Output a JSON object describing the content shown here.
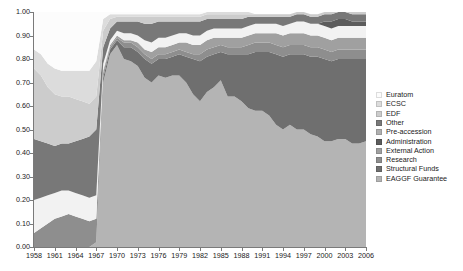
{
  "chart_data": {
    "type": "area",
    "title": "",
    "subtitle": "",
    "xlabel": "",
    "ylabel": "",
    "stacked": true,
    "normalized": true,
    "grid": false,
    "legend_position": "right",
    "xlim": [
      1958,
      2006
    ],
    "ylim": [
      0.0,
      1.0
    ],
    "y_ticks": [
      "0.00",
      "0.10",
      "0.20",
      "0.30",
      "0.40",
      "0.50",
      "0.60",
      "0.70",
      "0.80",
      "0.90",
      "1.00"
    ],
    "y_tick_values": [
      0.0,
      0.1,
      0.2,
      0.3,
      0.4,
      0.5,
      0.6,
      0.7,
      0.8,
      0.9,
      1.0
    ],
    "x_ticks": [
      "1958",
      "1961",
      "1964",
      "1967",
      "1970",
      "1973",
      "1976",
      "1979",
      "1982",
      "1985",
      "1988",
      "1991",
      "1994",
      "1997",
      "2000",
      "2003",
      "2006"
    ],
    "x_tick_values": [
      1958,
      1961,
      1964,
      1967,
      1970,
      1973,
      1976,
      1979,
      1982,
      1985,
      1988,
      1991,
      1994,
      1997,
      2000,
      2003,
      2006
    ],
    "x": [
      1958,
      1959,
      1960,
      1961,
      1962,
      1963,
      1964,
      1965,
      1966,
      1967,
      1968,
      1969,
      1970,
      1971,
      1972,
      1973,
      1974,
      1975,
      1976,
      1977,
      1978,
      1979,
      1980,
      1981,
      1982,
      1983,
      1984,
      1985,
      1986,
      1987,
      1988,
      1989,
      1990,
      1991,
      1992,
      1993,
      1994,
      1995,
      1996,
      1997,
      1998,
      1999,
      2000,
      2001,
      2002,
      2003,
      2004,
      2005,
      2006
    ],
    "series": [
      {
        "name": "EAGGF Guarantee",
        "color": "#b4b4b4",
        "values": [
          0.0,
          0.0,
          0.0,
          0.0,
          0.0,
          0.0,
          0.0,
          0.0,
          0.0,
          0.02,
          0.7,
          0.82,
          0.86,
          0.8,
          0.79,
          0.77,
          0.72,
          0.7,
          0.73,
          0.72,
          0.73,
          0.73,
          0.7,
          0.65,
          0.62,
          0.66,
          0.68,
          0.71,
          0.64,
          0.64,
          0.62,
          0.59,
          0.58,
          0.58,
          0.56,
          0.52,
          0.5,
          0.52,
          0.5,
          0.5,
          0.48,
          0.47,
          0.45,
          0.45,
          0.46,
          0.46,
          0.44,
          0.44,
          0.45
        ]
      },
      {
        "name": "Structural Funds",
        "color": "#6f6f6f",
        "values": [
          0.0,
          0.0,
          0.0,
          0.0,
          0.0,
          0.0,
          0.0,
          0.0,
          0.0,
          0.0,
          0.02,
          0.02,
          0.02,
          0.05,
          0.06,
          0.06,
          0.08,
          0.08,
          0.07,
          0.08,
          0.08,
          0.09,
          0.11,
          0.15,
          0.17,
          0.15,
          0.14,
          0.12,
          0.18,
          0.18,
          0.2,
          0.23,
          0.25,
          0.25,
          0.27,
          0.3,
          0.31,
          0.3,
          0.32,
          0.32,
          0.33,
          0.34,
          0.35,
          0.34,
          0.34,
          0.34,
          0.36,
          0.36,
          0.35
        ]
      },
      {
        "name": "Research",
        "color": "#8e8e8e",
        "values": [
          0.06,
          0.08,
          0.1,
          0.12,
          0.13,
          0.14,
          0.13,
          0.12,
          0.11,
          0.1,
          0.02,
          0.01,
          0.01,
          0.02,
          0.02,
          0.02,
          0.02,
          0.02,
          0.02,
          0.02,
          0.02,
          0.02,
          0.02,
          0.02,
          0.03,
          0.03,
          0.03,
          0.03,
          0.03,
          0.03,
          0.03,
          0.04,
          0.04,
          0.04,
          0.04,
          0.04,
          0.04,
          0.04,
          0.04,
          0.04,
          0.04,
          0.04,
          0.04,
          0.04,
          0.04,
          0.04,
          0.04,
          0.04,
          0.04
        ]
      },
      {
        "name": "External Action",
        "color": "#a0a0a0",
        "values": [
          0.0,
          0.0,
          0.0,
          0.0,
          0.0,
          0.0,
          0.0,
          0.0,
          0.0,
          0.0,
          0.01,
          0.01,
          0.01,
          0.01,
          0.01,
          0.02,
          0.02,
          0.03,
          0.03,
          0.03,
          0.03,
          0.03,
          0.04,
          0.04,
          0.04,
          0.04,
          0.04,
          0.03,
          0.04,
          0.04,
          0.04,
          0.04,
          0.04,
          0.04,
          0.04,
          0.05,
          0.05,
          0.05,
          0.05,
          0.05,
          0.05,
          0.05,
          0.05,
          0.05,
          0.05,
          0.05,
          0.05,
          0.05,
          0.05
        ]
      },
      {
        "name": "Administration",
        "color": "#f2f2f2",
        "values": [
          0.14,
          0.13,
          0.12,
          0.11,
          0.11,
          0.1,
          0.1,
          0.1,
          0.1,
          0.1,
          0.03,
          0.02,
          0.02,
          0.03,
          0.03,
          0.03,
          0.04,
          0.04,
          0.04,
          0.04,
          0.04,
          0.04,
          0.04,
          0.04,
          0.04,
          0.04,
          0.04,
          0.04,
          0.04,
          0.04,
          0.04,
          0.04,
          0.04,
          0.04,
          0.04,
          0.04,
          0.04,
          0.04,
          0.05,
          0.05,
          0.05,
          0.05,
          0.05,
          0.05,
          0.05,
          0.05,
          0.05,
          0.05,
          0.05
        ]
      },
      {
        "name": "Pre-accession",
        "color": "#5c5c5c",
        "values": [
          0.0,
          0.0,
          0.0,
          0.0,
          0.0,
          0.0,
          0.0,
          0.0,
          0.0,
          0.0,
          0.0,
          0.0,
          0.0,
          0.0,
          0.0,
          0.0,
          0.0,
          0.0,
          0.0,
          0.0,
          0.0,
          0.0,
          0.0,
          0.0,
          0.0,
          0.0,
          0.0,
          0.0,
          0.0,
          0.0,
          0.0,
          0.0,
          0.0,
          0.0,
          0.0,
          0.0,
          0.0,
          0.0,
          0.0,
          0.0,
          0.0,
          0.0,
          0.02,
          0.03,
          0.03,
          0.03,
          0.02,
          0.02,
          0.02
        ]
      },
      {
        "name": "Other",
        "color": "#787878",
        "values": [
          0.26,
          0.24,
          0.22,
          0.2,
          0.2,
          0.2,
          0.22,
          0.24,
          0.26,
          0.28,
          0.07,
          0.05,
          0.04,
          0.05,
          0.05,
          0.06,
          0.07,
          0.08,
          0.07,
          0.07,
          0.06,
          0.05,
          0.05,
          0.06,
          0.06,
          0.05,
          0.04,
          0.04,
          0.04,
          0.04,
          0.04,
          0.04,
          0.03,
          0.03,
          0.03,
          0.03,
          0.04,
          0.03,
          0.03,
          0.03,
          0.03,
          0.03,
          0.03,
          0.03,
          0.03,
          0.03,
          0.03,
          0.03,
          0.03
        ]
      },
      {
        "name": "EDF",
        "color": "#cccccc",
        "values": [
          0.3,
          0.28,
          0.24,
          0.22,
          0.2,
          0.2,
          0.18,
          0.16,
          0.14,
          0.14,
          0.07,
          0.04,
          0.02,
          0.02,
          0.02,
          0.02,
          0.03,
          0.03,
          0.02,
          0.02,
          0.02,
          0.02,
          0.02,
          0.02,
          0.02,
          0.02,
          0.02,
          0.02,
          0.02,
          0.02,
          0.02,
          0.01,
          0.01,
          0.01,
          0.01,
          0.01,
          0.01,
          0.01,
          0.01,
          0.01,
          0.01,
          0.01,
          0.01,
          0.01,
          0.01,
          0.01,
          0.01,
          0.01,
          0.01
        ]
      },
      {
        "name": "ECSC",
        "color": "#dcdcdc",
        "values": [
          0.08,
          0.09,
          0.1,
          0.11,
          0.11,
          0.11,
          0.12,
          0.13,
          0.14,
          0.15,
          0.05,
          0.02,
          0.01,
          0.01,
          0.01,
          0.01,
          0.01,
          0.01,
          0.01,
          0.01,
          0.01,
          0.01,
          0.01,
          0.01,
          0.01,
          0.01,
          0.01,
          0.01,
          0.01,
          0.01,
          0.01,
          0.01,
          0.0,
          0.0,
          0.0,
          0.0,
          0.0,
          0.0,
          0.0,
          0.0,
          0.0,
          0.0,
          0.0,
          0.0,
          0.0,
          0.0,
          0.0,
          0.0,
          0.0
        ]
      },
      {
        "name": "Euratom",
        "color": "#fcfcfc",
        "values": [
          0.16,
          0.18,
          0.22,
          0.24,
          0.25,
          0.25,
          0.25,
          0.25,
          0.25,
          0.21,
          0.03,
          0.01,
          0.01,
          0.01,
          0.01,
          0.01,
          0.01,
          0.01,
          0.01,
          0.01,
          0.01,
          0.01,
          0.01,
          0.01,
          0.01,
          0.0,
          0.0,
          0.0,
          0.0,
          0.0,
          0.0,
          0.0,
          0.0,
          0.0,
          0.0,
          0.0,
          0.0,
          0.0,
          0.0,
          0.0,
          0.0,
          0.0,
          0.0,
          0.0,
          0.0,
          0.0,
          0.0,
          0.0,
          0.0
        ]
      }
    ],
    "legend_entries": [
      {
        "label": "Euratom",
        "color": "#fcfcfc"
      },
      {
        "label": "ECSC",
        "color": "#dcdcdc"
      },
      {
        "label": "EDF",
        "color": "#cccccc"
      },
      {
        "label": "Other",
        "color": "#787878"
      },
      {
        "label": "Pre-accession",
        "color": "#b0b0b0"
      },
      {
        "label": "Administration",
        "color": "#5c5c5c"
      },
      {
        "label": "External Action",
        "color": "#a0a0a0"
      },
      {
        "label": "Research",
        "color": "#8e8e8e"
      },
      {
        "label": "Structural Funds",
        "color": "#6f6f6f"
      },
      {
        "label": "EAGGF Guarantee",
        "color": "#b4b4b4"
      }
    ],
    "axis_color": "#7a7a7a",
    "text_color": "#1a1a1a",
    "background": "#ffffff"
  }
}
